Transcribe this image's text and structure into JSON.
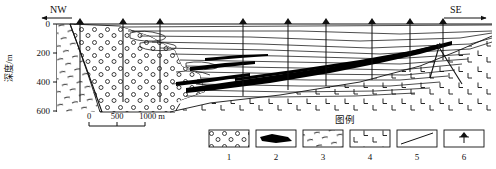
{
  "figure": {
    "kind": "geological-cross-section",
    "axis": {
      "title": "深度/m",
      "tick_labels": [
        "0",
        "200",
        "400",
        "600"
      ],
      "tick_values": [
        0,
        200,
        400,
        600
      ],
      "range": [
        0,
        700
      ]
    },
    "directions": {
      "left": "NW",
      "right": "SE"
    },
    "scale_bar": {
      "labels": [
        "0",
        "500",
        "1000 m"
      ],
      "values": [
        0,
        500,
        1000
      ],
      "unit": "m"
    },
    "boreholes": {
      "count": 9,
      "marker": "borehole-marker",
      "x_positions": [
        80,
        123,
        160,
        243,
        288,
        326,
        372,
        410,
        443
      ],
      "depths": [
        78,
        78,
        78,
        72,
        66,
        62,
        58,
        54,
        50
      ]
    },
    "units": {
      "conglomerate": "circle-stipple",
      "coal_seam": "solid-black",
      "schist": "dash-stipple",
      "volcanic": "l-symbol",
      "fault": "diagonal-line",
      "borehole": "borehole-symbol"
    },
    "colors": {
      "ink": "#111111",
      "paper": "#ffffff",
      "coal": "#000000"
    }
  },
  "legend": {
    "title": "图例",
    "items": [
      {
        "number": "1",
        "symbol": "circle-stipple",
        "name": "conglomerate-sandstone"
      },
      {
        "number": "2",
        "symbol": "solid-black",
        "name": "coal-seam"
      },
      {
        "number": "3",
        "symbol": "dash-stipple",
        "name": "schist-metamorphic"
      },
      {
        "number": "4",
        "symbol": "l-symbol",
        "name": "volcanic-basement"
      },
      {
        "number": "5",
        "symbol": "diagonal-line",
        "name": "fault-line"
      },
      {
        "number": "6",
        "symbol": "borehole-symbol",
        "name": "borehole"
      }
    ]
  }
}
